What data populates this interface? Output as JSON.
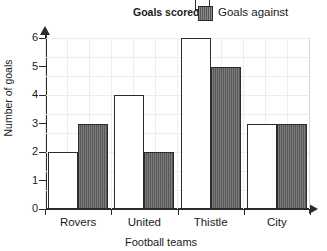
{
  "chart_data": {
    "type": "bar",
    "title": "",
    "categories": [
      "Rovers",
      "United",
      "Thistle",
      "City"
    ],
    "series": [
      {
        "name": "Goals scored",
        "values": [
          2,
          4,
          6,
          3
        ],
        "color": "#ffffff",
        "swatch": "white"
      },
      {
        "name": "Goals against",
        "values": [
          3,
          2,
          5,
          3
        ],
        "color": "#575757",
        "swatch": "hatch"
      }
    ],
    "xlabel": "Football teams",
    "ylabel": "Number of goals",
    "ylim": [
      0,
      6
    ],
    "ytick_labels": [
      "0",
      "1",
      "2",
      "3",
      "4",
      "5",
      "6"
    ],
    "grid": true,
    "legend_position": "top-right"
  },
  "legend": {
    "scored_label": "Goals scored",
    "against_label": "Goals against"
  },
  "axes": {
    "ylabel": "Number of goals",
    "xlabel": "Football teams"
  }
}
